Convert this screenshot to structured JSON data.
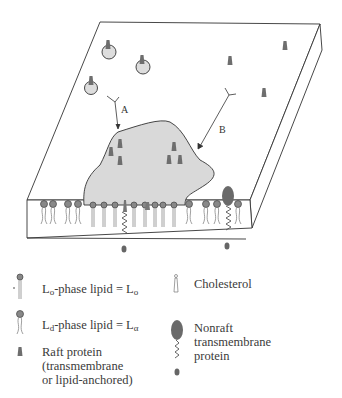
{
  "diagram": {
    "labels": {
      "arrow_a": "A",
      "arrow_b": "B"
    },
    "colors": {
      "outline": "#333333",
      "raft_fill": "#d9d9d9",
      "protein": "#6e6e6e",
      "headgroup": "#777777",
      "nonraft_protein": "#6a6a6a"
    }
  },
  "legend": {
    "lo_lipid": {
      "prefix": "L",
      "sub": "o",
      "text": "-phase lipid = L",
      "sub2": "o"
    },
    "ld_lipid": {
      "prefix": "L",
      "sub": "d",
      "text": "-phase lipid = L",
      "sub2": "α"
    },
    "raft_protein": {
      "line1": "Raft protein",
      "line2": "(transmembrane",
      "line3": "or lipid-anchored)"
    },
    "cholesterol": {
      "label": "Cholesterol"
    },
    "nonraft_protein": {
      "line1": "Nonraft",
      "line2": "transmembrane",
      "line3": "protein"
    }
  }
}
